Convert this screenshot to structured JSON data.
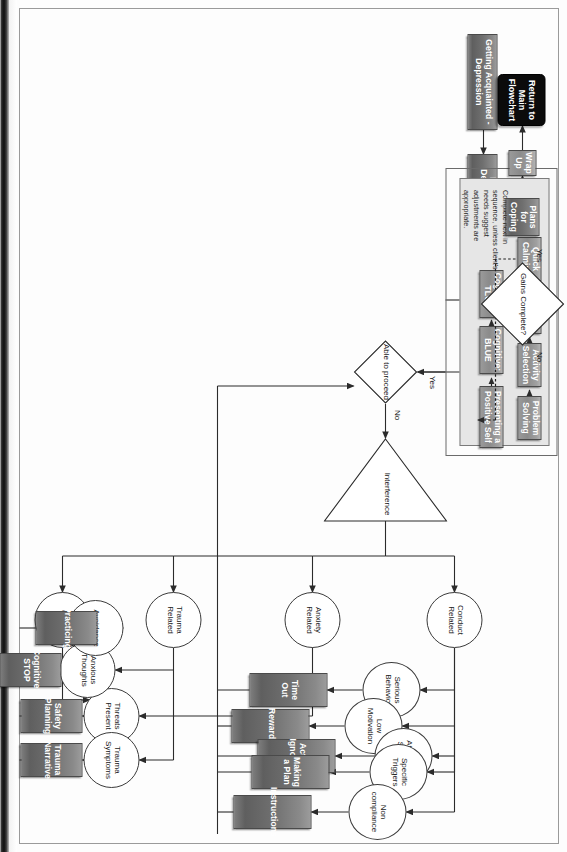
{
  "chart_title": "Depression / Modular Treatment Flowchart",
  "diagram": {
    "type": "flowchart",
    "orientation": "landscape page scanned rotated 90 degrees clockwise",
    "intake_sequence": [
      {
        "id": "getting-acquainted",
        "label": "Getting Acquainted - Depression",
        "shape": "process"
      },
      {
        "id": "learning-depression-child",
        "label": "Learning Depression - Child",
        "shape": "process"
      },
      {
        "id": "learning-depression-parent",
        "label": "Learning Depression - Parent",
        "shape": "process"
      }
    ],
    "decisions": [
      {
        "id": "able-to-proceed",
        "label": "Able to proceed",
        "shape": "diamond",
        "yes": "Yes",
        "no": "No"
      },
      {
        "id": "gains-complete",
        "label": "Gains Complete?",
        "shape": "diamond",
        "yes": "Yes",
        "no": "No"
      }
    ],
    "interference": {
      "id": "interference",
      "label": "Interference",
      "shape": "triangle"
    },
    "core_panel": {
      "note": "Complete next in sequence, unless client's needs suggest adjustments are appropriate.",
      "row_one": [
        {
          "id": "problem-solving",
          "label": "Problem Solving",
          "shape": "process"
        },
        {
          "id": "activity-selection",
          "label": "Activity Selection",
          "shape": "process"
        },
        {
          "id": "learning-to-relax",
          "label": "Learning to Relax",
          "shape": "process"
        },
        {
          "id": "quick-calming",
          "label": "Quick Calming",
          "shape": "process"
        }
      ],
      "row_two": [
        {
          "id": "presenting-a-positive-self",
          "label": "Presenting a Positive Self",
          "shape": "process"
        },
        {
          "id": "cognitive-blue",
          "label": "Cognitive: BLUE",
          "shape": "process"
        },
        {
          "id": "cognitive-tlc",
          "label": "Cognitive: TLC",
          "shape": "process"
        }
      ]
    },
    "wrap_up_sequence": [
      {
        "id": "plans-for-coping",
        "label": "Plans for Coping",
        "shape": "process"
      },
      {
        "id": "wrap-up",
        "label": "Wrap Up",
        "shape": "process"
      },
      {
        "id": "return-to-main-flowchart",
        "label": "Return to Main Flowchart",
        "shape": "terminator"
      }
    ],
    "interference_branches": [
      {
        "id": "conduct-related",
        "label": "Conduct Related",
        "shape": "circle"
      },
      {
        "id": "anxiety-related",
        "label": "Anxiety Related",
        "shape": "circle"
      },
      {
        "id": "trauma-related",
        "label": "Trauma Related",
        "shape": "circle"
      },
      {
        "id": "other",
        "label": "Other",
        "shape": "circle"
      }
    ],
    "conduct_branch": [
      {
        "id": "serious-behavior",
        "trigger": "Serious Behavior",
        "module": "Time Out"
      },
      {
        "id": "low-motivation",
        "trigger": "Low Motivation",
        "module": "Rewards"
      },
      {
        "id": "attention-seeking",
        "trigger": "Attention Seeking",
        "module": "Active Ignoring"
      },
      {
        "id": "specific-triggers",
        "trigger": "Specific Triggers",
        "module": "Making a Plan"
      },
      {
        "id": "non-compliance",
        "trigger": "Non compliance",
        "module": "Instructions"
      }
    ],
    "anxiety_trauma_branch": [
      {
        "id": "threats-present",
        "trigger": "Threats Present",
        "module": "Safety Planning"
      },
      {
        "id": "trauma-symptoms",
        "trigger": "Trauma Symptoms",
        "module": "Trauma Narrative"
      },
      {
        "id": "anxious-thoughts",
        "trigger": "Anxious Thoughts",
        "module": "Cognitive: STOP"
      },
      {
        "id": "avoidance",
        "trigger": "Avoidance",
        "module": "Practicing"
      }
    ],
    "colors": {
      "process_fill": "#6f6f6f",
      "process_text": "#ffffff",
      "terminator_fill": "#0b0b0b",
      "panel_fill": "#e6e6e6",
      "line": "#3b3b3b",
      "page": "#ffffff"
    }
  }
}
